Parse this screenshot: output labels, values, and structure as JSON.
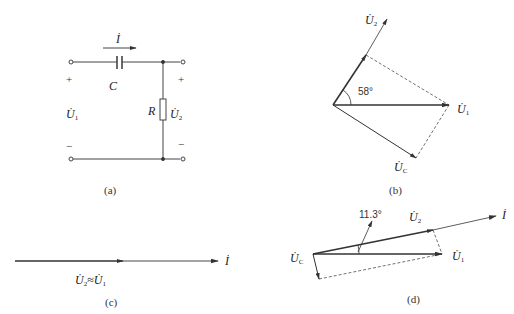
{
  "panels": {
    "a": {
      "caption": "(a)",
      "current_label": "İ",
      "capacitor_label": "C",
      "resistor_label": "R",
      "input_voltage": {
        "symbol": "U̇",
        "sub": "1"
      },
      "output_voltage": {
        "symbol": "U̇",
        "sub": "2"
      },
      "plus_sign": "+",
      "minus_sign": "−"
    },
    "b": {
      "caption": "(b)",
      "angle_label": "58°",
      "phasors": {
        "u1": {
          "symbol": "U̇",
          "sub": "1"
        },
        "u2": {
          "symbol": "U̇",
          "sub": "2"
        },
        "uc": {
          "symbol": "U̇",
          "sub": "C"
        }
      }
    },
    "c": {
      "caption": "(c)",
      "current_label": "İ",
      "relation": {
        "lhs": "U̇",
        "lhs_sub": "2",
        "op": "≈",
        "rhs": "U̇",
        "rhs_sub": "1"
      }
    },
    "d": {
      "caption": "(d)",
      "angle_label": "11.3°",
      "current_label": "İ",
      "phasors": {
        "u1": {
          "symbol": "U̇",
          "sub": "1"
        },
        "u2": {
          "symbol": "U̇",
          "sub": "2"
        },
        "uc": {
          "symbol": "U̇",
          "sub": "C"
        }
      }
    }
  },
  "colors": {
    "line": "#333333",
    "background": "#ffffff"
  }
}
